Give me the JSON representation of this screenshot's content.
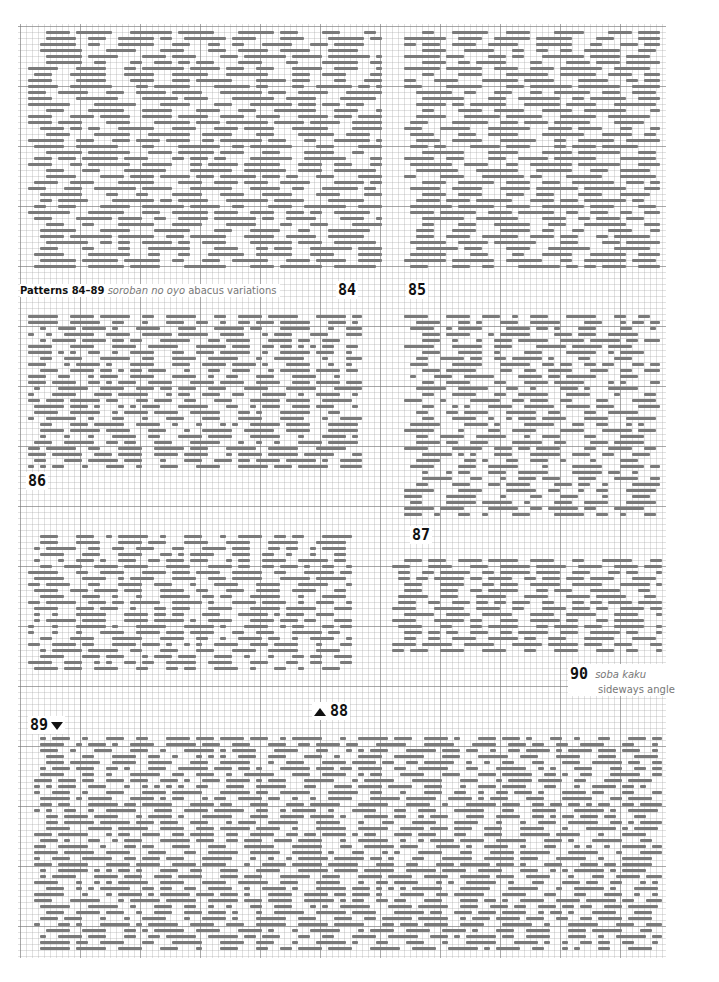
{
  "caption": {
    "title_bold": "Patterns 84–89",
    "title_italic": "soroban no oyo",
    "title_rest": "abacus variations"
  },
  "labels": {
    "p84": "84",
    "p85": "85",
    "p86": "86",
    "p87": "87",
    "p88": "88",
    "p89": "89",
    "p90": "90",
    "p90_italic": "soba kaku",
    "p90_sub": "sideways angle"
  },
  "colors": {
    "stitch": "#7a7a7a",
    "grid_major": "#787878",
    "grid_minor": "#aaaaaa",
    "text": "#111111",
    "caption_grey": "#777777"
  },
  "patches": [
    {
      "name": "pattern-84",
      "x": 22,
      "y": 30,
      "w": 360,
      "h": 244,
      "rowH": 6,
      "seed": 1,
      "style": "diamond"
    },
    {
      "name": "pattern-85",
      "x": 398,
      "y": 30,
      "w": 262,
      "h": 244,
      "rowH": 6,
      "seed": 2,
      "style": "diamond"
    },
    {
      "name": "pattern-86",
      "x": 22,
      "y": 314,
      "w": 340,
      "h": 156,
      "rowH": 6,
      "seed": 3,
      "style": "brick"
    },
    {
      "name": "pattern-87",
      "x": 398,
      "y": 314,
      "w": 262,
      "h": 208,
      "rowH": 6,
      "seed": 4,
      "style": "bead"
    },
    {
      "name": "pattern-88",
      "x": 22,
      "y": 534,
      "w": 330,
      "h": 140,
      "rowH": 6,
      "seed": 5,
      "style": "brick"
    },
    {
      "name": "pattern-90",
      "x": 386,
      "y": 558,
      "w": 276,
      "h": 100,
      "rowH": 6,
      "seed": 6,
      "style": "grid"
    },
    {
      "name": "pattern-89",
      "x": 28,
      "y": 736,
      "w": 634,
      "h": 216,
      "rowH": 6,
      "seed": 7,
      "style": "brick"
    }
  ]
}
